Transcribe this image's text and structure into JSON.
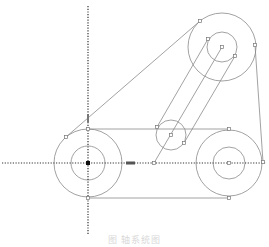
{
  "caption": "图    轴系统图",
  "colors": {
    "line": "#8a8a8a",
    "axis": "#333333",
    "handle": "#777777",
    "background": "#ffffff"
  },
  "axes": {
    "horizontal": {
      "x1": 2,
      "y": 163,
      "x2": 266
    },
    "vertical": {
      "x": 88,
      "y1": 6,
      "y2": 235
    }
  },
  "pulleys": [
    {
      "name": "left-pulley",
      "cx": 88,
      "cy": 163,
      "r_outer": 34,
      "r_inner": 17
    },
    {
      "name": "right-pulley",
      "cx": 229,
      "cy": 163,
      "r_outer": 33,
      "r_inner": 16
    },
    {
      "name": "top-pulley",
      "cx": 222,
      "cy": 47,
      "r_outer": 34,
      "r_inner": 15
    }
  ],
  "idler": {
    "cx": 171,
    "cy": 135,
    "r": 15
  },
  "belt_lines": [
    {
      "x1": 88,
      "y1": 129,
      "x2": 229,
      "y2": 129
    },
    {
      "x1": 88,
      "y1": 198,
      "x2": 229,
      "y2": 198
    },
    {
      "x1": 66,
      "y1": 137,
      "x2": 200,
      "y2": 21
    },
    {
      "x1": 255,
      "y1": 45,
      "x2": 263,
      "y2": 162
    }
  ],
  "arm_lines": [
    {
      "x1": 157,
      "y1": 127,
      "x2": 208,
      "y2": 39
    },
    {
      "x1": 184,
      "y1": 143,
      "x2": 235,
      "y2": 56
    },
    {
      "x1": 154,
      "y1": 163,
      "x2": 222,
      "y2": 47
    }
  ],
  "handles": [
    [
      200,
      21
    ],
    [
      208,
      39
    ],
    [
      222,
      47
    ],
    [
      235,
      56
    ],
    [
      255,
      45
    ],
    [
      157,
      127
    ],
    [
      171,
      135
    ],
    [
      184,
      143
    ],
    [
      229,
      129
    ],
    [
      229,
      198
    ],
    [
      88,
      129
    ],
    [
      88,
      198
    ],
    [
      66,
      137
    ],
    [
      154,
      163
    ],
    [
      229,
      163
    ],
    [
      263,
      162
    ]
  ],
  "center_mark": {
    "x": 88,
    "y": 163
  },
  "drag_marker": {
    "x": 130,
    "y": 163
  },
  "vertical_marker": {
    "x": 88,
    "y": 118
  }
}
